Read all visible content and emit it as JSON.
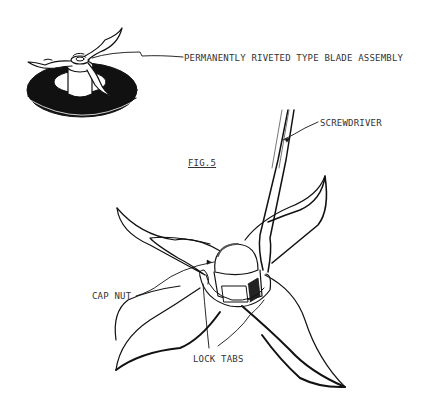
{
  "figure": {
    "title": "FIG.5",
    "labels": {
      "blade_assembly": "PERMANENTLY RIVETED TYPE BLADE ASSEMBLY",
      "screwdriver": "SCREWDRIVER",
      "cap_nut": "CAP NUT",
      "lock_tabs": "LOCK TABS"
    }
  },
  "colors": {
    "ink": "#111111",
    "text": "#333333",
    "background": "#ffffff"
  }
}
